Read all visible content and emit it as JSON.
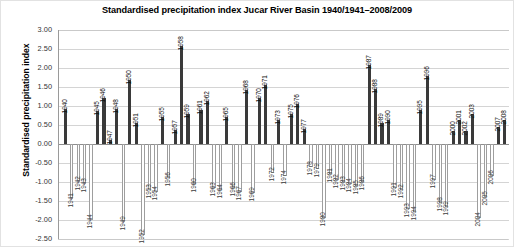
{
  "chart_data": {
    "type": "bar",
    "title": "Standardised precipitation index Jucar River Basin 1940/1941–2008/2009",
    "xlabel": "",
    "ylabel": "Standardised precipitation index",
    "ylim": [
      -2.5,
      3.0
    ],
    "yticks": [
      "3.00",
      "2.50",
      "2.00",
      "1.50",
      "1.00",
      "0.50",
      "0.00",
      "-0.50",
      "-1.00",
      "-1.50",
      "-2.00",
      "-2.50"
    ],
    "ytick_values": [
      3.0,
      2.5,
      2.0,
      1.5,
      1.0,
      0.5,
      0.0,
      -0.5,
      -1.0,
      -1.5,
      -2.0,
      -2.5
    ],
    "grid": true,
    "legend": "none",
    "bar_color_positive": "#3a3a3a",
    "bar_color_negative": "#ffffff",
    "bar_edge_negative": "#9e9e9e",
    "categories": [
      "1940",
      "1941",
      "1942",
      "1943",
      "1944",
      "1945",
      "1946",
      "1947",
      "1948",
      "1949",
      "1950",
      "1951",
      "1952",
      "1953",
      "1954",
      "1955",
      "1956",
      "1957",
      "1958",
      "1959",
      "1960",
      "1961",
      "1962",
      "1963",
      "1964",
      "1965",
      "1966",
      "1967",
      "1968",
      "1969",
      "1970",
      "1971",
      "1972",
      "1973",
      "1974",
      "1975",
      "1976",
      "1977",
      "1978",
      "1979",
      "1980",
      "1981",
      "1982",
      "1983",
      "1984",
      "1985",
      "1986",
      "1987",
      "1988",
      "1989",
      "1990",
      "1991",
      "1992",
      "1993",
      "1994",
      "1995",
      "1996",
      "1997",
      "1998",
      "1999",
      "2000",
      "2001",
      "2002",
      "2003",
      "2004",
      "2005",
      "2006",
      "2007",
      "2008"
    ],
    "values": [
      0.93,
      -1.45,
      -1.0,
      -1.05,
      -2.0,
      0.88,
      1.22,
      0.1,
      0.93,
      -2.05,
      1.68,
      0.55,
      -2.4,
      -1.2,
      -1.25,
      0.72,
      -0.9,
      0.37,
      2.58,
      0.78,
      -1.05,
      0.9,
      1.12,
      -1.15,
      -1.2,
      0.72,
      -1.15,
      -1.25,
      1.42,
      -1.3,
      1.2,
      1.55,
      -0.75,
      0.62,
      -0.85,
      0.8,
      1.05,
      0.4,
      -0.6,
      -0.65,
      -1.95,
      -0.8,
      -0.95,
      -1.0,
      -1.05,
      -1.1,
      -1.0,
      2.08,
      1.45,
      0.55,
      0.62,
      -1.15,
      -1.2,
      -1.7,
      -1.8,
      0.9,
      1.78,
      -0.95,
      -1.55,
      -1.65,
      0.35,
      0.62,
      0.35,
      0.78,
      -1.95,
      -1.4,
      -0.85,
      0.45,
      0.62
    ]
  }
}
